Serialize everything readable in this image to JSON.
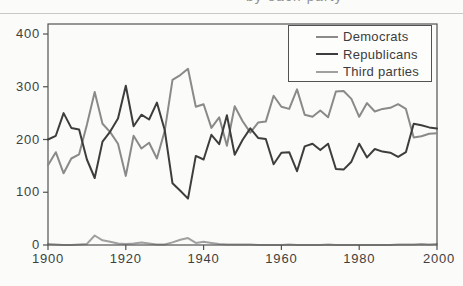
{
  "figure": {
    "title_fragment": "by each party",
    "note": "title cropped at top edge; only letter descenders visible"
  },
  "colors": {
    "democrats": "#8a8a8a",
    "republicans": "#3d3d3d",
    "third_parties": "#a0a0a0",
    "axis": "#525252",
    "text": "#3f3f3f",
    "scan_artifact": "#c9c9c6"
  },
  "chart_data": {
    "type": "line",
    "title": "by each party",
    "xlabel": "",
    "ylabel": "",
    "xlim": [
      1900,
      2000
    ],
    "ylim": [
      0,
      420
    ],
    "grid": false,
    "legend_position": "top-right",
    "x_tick_values": [
      1900,
      1920,
      1940,
      1960,
      1980,
      2000
    ],
    "y_tick_values": [
      400,
      300,
      200,
      100,
      0
    ],
    "x": [
      1900,
      1902,
      1904,
      1906,
      1908,
      1910,
      1912,
      1914,
      1916,
      1918,
      1920,
      1922,
      1924,
      1926,
      1928,
      1930,
      1932,
      1934,
      1936,
      1938,
      1940,
      1942,
      1944,
      1946,
      1948,
      1950,
      1952,
      1954,
      1956,
      1958,
      1960,
      1962,
      1964,
      1966,
      1968,
      1970,
      1972,
      1974,
      1976,
      1978,
      1980,
      1982,
      1984,
      1986,
      1988,
      1990,
      1992,
      1994,
      1996,
      1998,
      2000
    ],
    "series": [
      {
        "name": "Democrats",
        "color": "#8a8a8a",
        "values": [
          151,
          176,
          136,
          164,
          172,
          228,
          290,
          230,
          214,
          192,
          131,
          207,
          183,
          194,
          164,
          216,
          313,
          322,
          334,
          262,
          267,
          222,
          242,
          188,
          263,
          235,
          213,
          232,
          234,
          283,
          262,
          258,
          295,
          247,
          243,
          255,
          242,
          291,
          292,
          277,
          243,
          269,
          253,
          258,
          260,
          267,
          258,
          204,
          206,
          211,
          212
        ]
      },
      {
        "name": "Republicans",
        "color": "#3d3d3d",
        "values": [
          200,
          207,
          250,
          222,
          219,
          162,
          127,
          196,
          215,
          240,
          302,
          225,
          247,
          238,
          270,
          218,
          117,
          103,
          88,
          169,
          162,
          209,
          191,
          246,
          171,
          199,
          221,
          203,
          201,
          153,
          175,
          176,
          140,
          187,
          192,
          180,
          192,
          144,
          143,
          158,
          192,
          166,
          182,
          177,
          175,
          167,
          176,
          230,
          227,
          223,
          221
        ]
      },
      {
        "name": "Third parties",
        "color": "#a0a0a0",
        "values": [
          2,
          1,
          0,
          0,
          1,
          2,
          18,
          9,
          6,
          3,
          2,
          3,
          5,
          3,
          1,
          1,
          5,
          10,
          13,
          4,
          6,
          4,
          2,
          1,
          1,
          1,
          1,
          0,
          0,
          0,
          0,
          1,
          0,
          0,
          0,
          0,
          1,
          0,
          0,
          0,
          0,
          0,
          0,
          0,
          0,
          1,
          1,
          1,
          2,
          1,
          2
        ]
      }
    ]
  }
}
